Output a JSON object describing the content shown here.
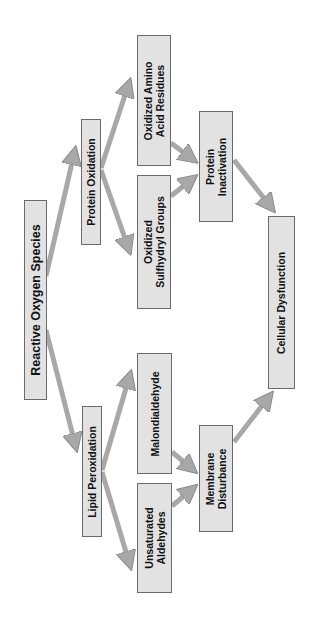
{
  "diagram": {
    "orientation": "rotated-90-ccw",
    "colors": {
      "box_fill": "#e2e2e2",
      "box_border": "#6a6a6a",
      "arrow": "#a8a8a8",
      "arrow_edge": "#8a8a8a",
      "text": "#111111"
    },
    "nodes": [
      {
        "id": "ros",
        "label": "Reactive Oxygen Species"
      },
      {
        "id": "protein_oxidation",
        "label": "Protein Oxidation"
      },
      {
        "id": "lipid_peroxidation",
        "label": "Lipid Peroxidation"
      },
      {
        "id": "oxidized_amino",
        "label": "Oxidized Amino\nAcid Residues"
      },
      {
        "id": "oxidized_sulfhydryl",
        "label": "Oxidized\nSulfhydryl Groups"
      },
      {
        "id": "malondialdehyde",
        "label": "Malondialdehyde"
      },
      {
        "id": "unsaturated_aldehydes",
        "label": "Unsaturated\nAldehydes"
      },
      {
        "id": "protein_inactivation",
        "label": "Protein\nInactivation"
      },
      {
        "id": "membrane_disturbance",
        "label": "Membrane\nDisturbance"
      },
      {
        "id": "cellular_dysfunction",
        "label": "Cellular Dysfunction"
      }
    ],
    "edges": [
      {
        "from": "ros",
        "to": "protein_oxidation"
      },
      {
        "from": "ros",
        "to": "lipid_peroxidation"
      },
      {
        "from": "protein_oxidation",
        "to": "oxidized_amino"
      },
      {
        "from": "protein_oxidation",
        "to": "oxidized_sulfhydryl"
      },
      {
        "from": "lipid_peroxidation",
        "to": "malondialdehyde"
      },
      {
        "from": "lipid_peroxidation",
        "to": "unsaturated_aldehydes"
      },
      {
        "from": "oxidized_amino",
        "to": "protein_inactivation"
      },
      {
        "from": "oxidized_sulfhydryl",
        "to": "protein_inactivation"
      },
      {
        "from": "malondialdehyde",
        "to": "membrane_disturbance"
      },
      {
        "from": "unsaturated_aldehydes",
        "to": "membrane_disturbance"
      },
      {
        "from": "protein_inactivation",
        "to": "cellular_dysfunction"
      },
      {
        "from": "membrane_disturbance",
        "to": "cellular_dysfunction"
      }
    ]
  }
}
